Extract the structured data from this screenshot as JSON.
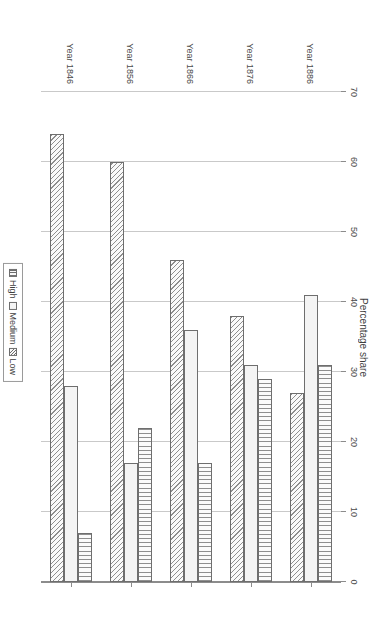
{
  "chart_data": {
    "type": "bar",
    "orientation": "horizontal",
    "title": "",
    "xlabel": "Percentage share",
    "ylabel": "",
    "categories": [
      "Year 1846",
      "Year 1856",
      "Year 1866",
      "Year 1876",
      "Year 1886"
    ],
    "series": [
      {
        "name": "Low",
        "values": [
          64,
          60,
          46,
          38,
          27
        ]
      },
      {
        "name": "Medium",
        "values": [
          28,
          17,
          36,
          31,
          41
        ]
      },
      {
        "name": "High",
        "values": [
          7,
          22,
          17,
          29,
          31
        ]
      }
    ],
    "xlim": [
      0,
      70
    ],
    "xticks": [
      0,
      10,
      20,
      30,
      40,
      50,
      60,
      70
    ],
    "grid": true,
    "legend_position": "top-center",
    "legend_entries": [
      "Low",
      "Medium",
      "High"
    ],
    "patterns": {
      "Low": "diagonal-hatch",
      "Medium": "solid-empty",
      "High": "vertical-lines"
    },
    "colors": {
      "bar_fill": "#f4f4f4",
      "bar_edge": "#6e6e6e",
      "hatch": "#8f8f8f",
      "gridline": "#c9c9c9",
      "axis": "#8c8c8c",
      "text": "#3f3f3f",
      "background": "#ffffff"
    }
  },
  "axis": {
    "value_label": "Percentage share"
  },
  "legend": {
    "items": [
      {
        "label": "Low"
      },
      {
        "label": "Medium"
      },
      {
        "label": "High"
      }
    ]
  }
}
